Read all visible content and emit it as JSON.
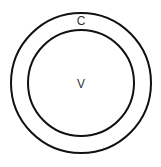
{
  "diagram": {
    "type": "nested-circles",
    "outer": {
      "label": "C",
      "cx": 81,
      "cy": 83,
      "r": 70
    },
    "inner": {
      "label": "V",
      "cx": 81,
      "cy": 83,
      "r": 53
    },
    "stroke_color": "#111111",
    "label_color": "#333333"
  }
}
